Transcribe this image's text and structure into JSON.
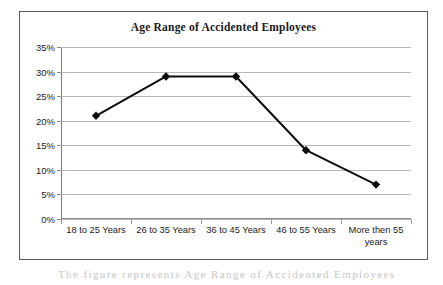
{
  "figure": {
    "caption_fragment": "The figure represents Age Range of Accidented Employees"
  },
  "chart_data": {
    "type": "line",
    "title": "Age Range of Accidented Employees",
    "xlabel": "",
    "ylabel": "",
    "categories": [
      "18 to 25 Years",
      "26 to 35 Years",
      "36 to 45 Years",
      "46 to 55 Years",
      "More then 55 years"
    ],
    "category_lines": [
      [
        "18 to 25 Years"
      ],
      [
        "26 to 35 Years"
      ],
      [
        "36 to 45 Years"
      ],
      [
        "46 to 55 Years"
      ],
      [
        "More then 55",
        "years"
      ]
    ],
    "values": [
      21,
      29,
      29,
      14,
      7
    ],
    "value_labels": [
      "21%",
      "29%",
      "29%",
      "14%",
      "7%"
    ],
    "ylim": [
      0,
      35
    ],
    "ytick_values": [
      35,
      30,
      25,
      20,
      15,
      10,
      5,
      0
    ],
    "ytick_labels": [
      "35%",
      "30%",
      "25%",
      "20%",
      "15%",
      "10%",
      "5%",
      "0%"
    ],
    "grid": true,
    "legend": false,
    "legend_position": "none",
    "marker": "diamond",
    "series_color": "#0d0d0d",
    "gridline_color": "#b9b9b9",
    "axis_color": "#8a8a8a",
    "frame_color": "#5b5b5b",
    "background_color": "#ffffff"
  }
}
